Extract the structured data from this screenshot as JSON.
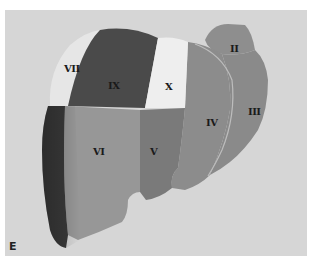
{
  "figure": {
    "panel_letter": "E",
    "background_color": "#d6d6d6",
    "segments": [
      {
        "id": "II",
        "label": "II",
        "shade": "#8e8e8e"
      },
      {
        "id": "III",
        "label": "III",
        "shade": "#8a8a8a"
      },
      {
        "id": "IV",
        "label": "IV",
        "shade": "#8c8c8c"
      },
      {
        "id": "V",
        "label": "V",
        "shade": "#7a7a7a"
      },
      {
        "id": "VI",
        "label": "VI",
        "shade": "#979797"
      },
      {
        "id": "VII",
        "label": "VII",
        "shade": "#e6e6e6"
      },
      {
        "id": "IX",
        "label": "IX",
        "shade": "#4a4a4a"
      },
      {
        "id": "X",
        "label": "X",
        "shade": "#eeeeee"
      },
      {
        "id": "posterior-right",
        "label": "",
        "shade": "#3a3a3a"
      }
    ]
  }
}
